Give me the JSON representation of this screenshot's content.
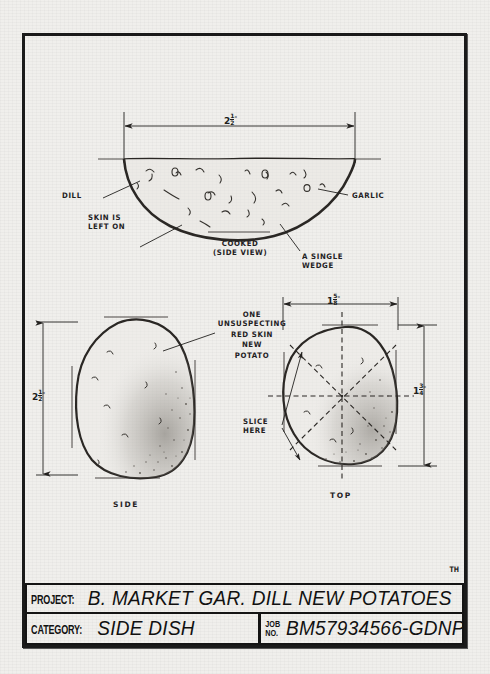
{
  "sheet": {
    "signature": "TH"
  },
  "drawings": {
    "cooked_wedge": {
      "width_dim": {
        "whole": "2",
        "num": "1",
        "den": "2",
        "unit": "\""
      },
      "caption_line1": "COOKED",
      "caption_line2": "(SIDE VIEW)",
      "labels": {
        "dill": "DILL",
        "garlic": "GARLIC",
        "skin_line1": "SKIN IS",
        "skin_line2": "LEFT ON",
        "wedge_line1": "A SINGLE",
        "wedge_line2": "WEDGE"
      }
    },
    "side_view": {
      "caption": "SIDE",
      "height_dim": {
        "whole": "2",
        "num": "1",
        "den": "2",
        "unit": "\""
      },
      "callout": [
        "ONE",
        "UNSUSPECTING",
        "RED SKIN",
        "NEW",
        "POTATO"
      ]
    },
    "top_view": {
      "caption": "TOP",
      "width_dim": {
        "whole": "1",
        "num": "5",
        "den": "8",
        "unit": "\""
      },
      "height_dim": {
        "whole": "1",
        "num": "3",
        "den": "4",
        "unit": "\""
      },
      "slice_label_line1": "SLICE",
      "slice_label_line2": "HERE"
    }
  },
  "title_block": {
    "project_label": "PROJECT:",
    "project_value": "B. MARKET GAR. DILL NEW POTATOES",
    "category_label": "CATEGORY:",
    "category_value": "SIDE DISH",
    "job_label_line1": "JOB",
    "job_label_line2": "NO.",
    "job_value": "BM57934566-GDNP"
  },
  "colors": {
    "ink": "#1a1a1a",
    "paper": "#f0efec",
    "pencil": "#46423d"
  }
}
